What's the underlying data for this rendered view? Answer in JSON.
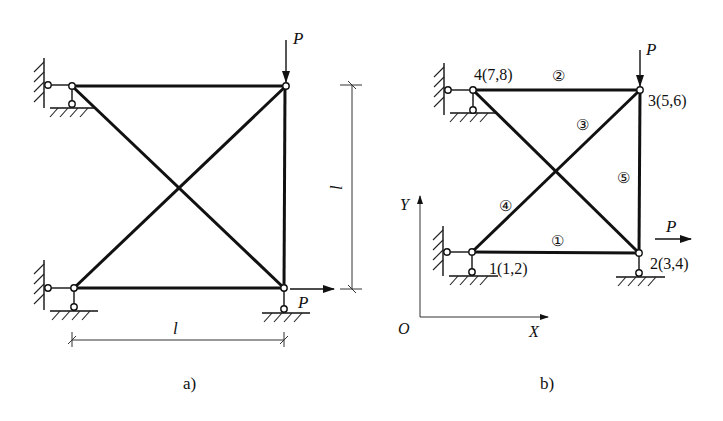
{
  "diagram_a": {
    "caption": "a)",
    "load_top_label": "P",
    "load_bottom_label": "P",
    "dim_horizontal_label": "l",
    "dim_vertical_label": "l"
  },
  "diagram_b": {
    "caption": "b)",
    "load_top_label": "P",
    "load_right_label": "P",
    "nodes": [
      {
        "id": "1",
        "label": "1(1,2)"
      },
      {
        "id": "2",
        "label": "2(3,4)"
      },
      {
        "id": "3",
        "label": "3(5,6)"
      },
      {
        "id": "4",
        "label": "4(7,8)"
      }
    ],
    "elements": [
      {
        "id": "1",
        "label": "①"
      },
      {
        "id": "2",
        "label": "②"
      },
      {
        "id": "3",
        "label": "③"
      },
      {
        "id": "4",
        "label": "④"
      },
      {
        "id": "5",
        "label": "⑤"
      }
    ],
    "axes": {
      "x_label": "X",
      "y_label": "Y",
      "origin_label": "O"
    }
  },
  "colors": {
    "ink": "#111111",
    "background": "#ffffff"
  }
}
